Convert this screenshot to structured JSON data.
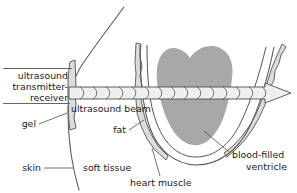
{
  "figure": {
    "type": "anatomical-diagram",
    "background_color": "#ffffff",
    "line_color": "#4a4a4a",
    "text_color": "#1a1a1a"
  },
  "colors": {
    "ventricle_fill": "#a8a8a8",
    "fat_fill": "#dcdcdc",
    "beam_fill": "#efefef",
    "outline": "#555555",
    "text": "#1a1a1a"
  },
  "labels": {
    "transmitter": {
      "line1": "ultrasound",
      "line2": "transmitter-",
      "line3": "receiver"
    },
    "beam": "ultrasound beam",
    "gel": "gel",
    "skin": "skin",
    "soft_tissue": "soft tissue",
    "fat": "fat",
    "heart_muscle": "heart muscle",
    "ventricle": {
      "line1": "blood-filled",
      "line2": "ventricle"
    }
  },
  "parts": [
    {
      "name": "ultrasound-transmitter-receiver",
      "label": "ultrasound transmitter-receiver"
    },
    {
      "name": "ultrasound-beam",
      "label": "ultrasound beam"
    },
    {
      "name": "gel",
      "label": "gel"
    },
    {
      "name": "skin",
      "label": "skin"
    },
    {
      "name": "soft-tissue",
      "label": "soft tissue"
    },
    {
      "name": "fat",
      "label": "fat"
    },
    {
      "name": "heart-muscle",
      "label": "heart muscle"
    },
    {
      "name": "blood-filled-ventricle",
      "label": "blood-filled ventricle"
    }
  ]
}
